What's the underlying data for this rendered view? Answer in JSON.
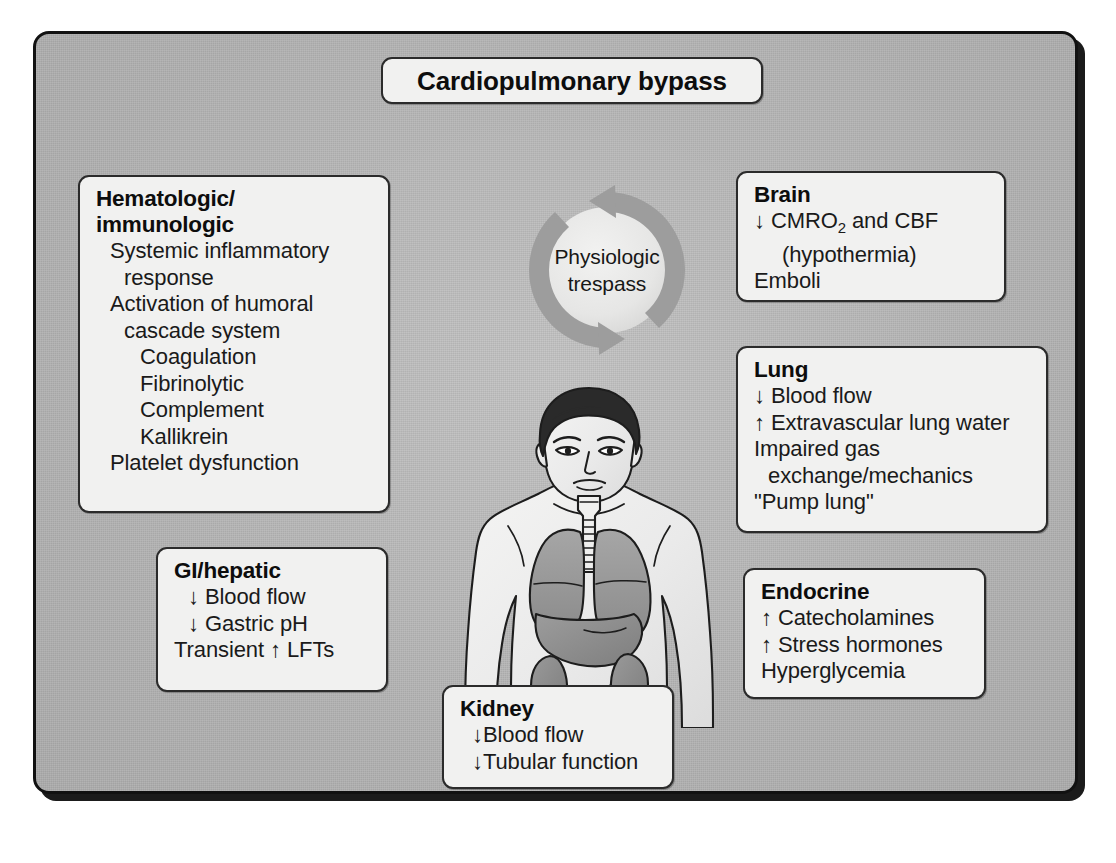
{
  "figure": {
    "title": "Cardiopulmonary bypass",
    "center": {
      "label_line1": "Physiologic",
      "label_line2": "trespass",
      "icon": "cycle-arrows-icon"
    },
    "illustration": {
      "name": "human-torso-organs-illustration",
      "organs": [
        "brain",
        "trachea",
        "lungs",
        "liver",
        "kidneys"
      ]
    },
    "colors": {
      "panel_background": "#b6b6b6",
      "box_fill": "#f1f1f0",
      "box_border": "#2b2b2b",
      "text": "#0d0d0d",
      "arrow_gray": "#9a9a9a",
      "organ_gray": "#8d8d8d"
    },
    "boxes": [
      {
        "id": "hematologic-immunologic",
        "heading": "Hematologic/\nimmunologic",
        "items": [
          {
            "text": "Systemic inflammatory",
            "indent": 1
          },
          {
            "text": "response",
            "indent": 2
          },
          {
            "text": "Activation of humoral",
            "indent": 1
          },
          {
            "text": "cascade system",
            "indent": 2
          },
          {
            "text": "Coagulation",
            "indent": 3
          },
          {
            "text": "Fibrinolytic",
            "indent": 3
          },
          {
            "text": "Complement",
            "indent": 3
          },
          {
            "text": "Kallikrein",
            "indent": 3
          },
          {
            "text": "Platelet dysfunction",
            "indent": 1
          }
        ]
      },
      {
        "id": "gi-hepatic",
        "heading": "GI/hepatic",
        "items": [
          {
            "text": "↓ Blood flow",
            "indent": 1
          },
          {
            "text": "↓ Gastric pH",
            "indent": 1
          },
          {
            "text": "Transient ↑ LFTs",
            "indent": 1
          }
        ]
      },
      {
        "id": "kidney",
        "heading": "Kidney",
        "items": [
          {
            "text": "↓Blood flow",
            "indent": 1
          },
          {
            "text": "↓Tubular function",
            "indent": 1
          }
        ]
      },
      {
        "id": "brain",
        "heading": "Brain",
        "items": [
          {
            "text": "↓ CMRO₂ and CBF",
            "indent": 1
          },
          {
            "text": "(hypothermia)",
            "indent": 2
          },
          {
            "text": "Emboli",
            "indent": 1
          }
        ]
      },
      {
        "id": "lung",
        "heading": "Lung",
        "items": [
          {
            "text": "↓ Blood flow",
            "indent": 1
          },
          {
            "text": "↑ Extravascular lung water",
            "indent": 1
          },
          {
            "text": "Impaired gas",
            "indent": 1
          },
          {
            "text": "exchange/mechanics",
            "indent": 2
          },
          {
            "text": "\"Pump lung\"",
            "indent": 1
          }
        ]
      },
      {
        "id": "endocrine",
        "heading": "Endocrine",
        "items": [
          {
            "text": "↑ Catecholamines",
            "indent": 1
          },
          {
            "text": "↑ Stress hormones",
            "indent": 1
          },
          {
            "text": "Hyperglycemia",
            "indent": 1
          }
        ]
      }
    ]
  }
}
